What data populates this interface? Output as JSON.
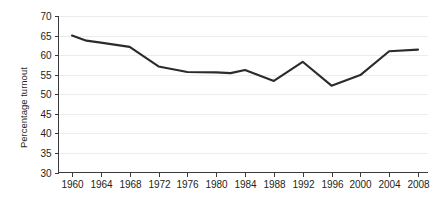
{
  "chart_data": {
    "type": "line",
    "title": "",
    "xlabel": "",
    "ylabel": "Percentage turnout",
    "categories": [
      "1960",
      "1964",
      "1968",
      "1972",
      "1976",
      "1980",
      "1984",
      "1988",
      "1992",
      "1996",
      "2000",
      "2004",
      "2008"
    ],
    "x": [
      1960,
      1964,
      1968,
      1972,
      1976,
      1980,
      1984,
      1988,
      1992,
      1996,
      2000,
      2004,
      2008
    ],
    "values": [
      65.0,
      62.1,
      60.9,
      55.2,
      53.6,
      52.6,
      53.3,
      50.2,
      55.2,
      49.0,
      51.2,
      56.7,
      58.2
    ],
    "series": [
      {
        "name": "Percentage turnout",
        "values": [
          65.0,
          62.1,
          60.9,
          55.2,
          53.6,
          52.6,
          53.3,
          50.2,
          55.2,
          49.0,
          51.2,
          56.7,
          58.2
        ]
      }
    ],
    "plot_points": [
      {
        "x": 1960,
        "y": 65.0
      },
      {
        "x": 1962,
        "y": 63.7
      },
      {
        "x": 1964,
        "y": 63.2
      },
      {
        "x": 1968,
        "y": 62.1
      },
      {
        "x": 1972,
        "y": 57.1
      },
      {
        "x": 1976,
        "y": 55.7
      },
      {
        "x": 1980,
        "y": 55.6
      },
      {
        "x": 1982,
        "y": 55.4
      },
      {
        "x": 1984,
        "y": 56.2
      },
      {
        "x": 1988,
        "y": 53.4
      },
      {
        "x": 1992,
        "y": 58.3
      },
      {
        "x": 1996,
        "y": 52.2
      },
      {
        "x": 2000,
        "y": 54.9
      },
      {
        "x": 2004,
        "y": 61.0
      },
      {
        "x": 2008,
        "y": 61.4
      }
    ],
    "ylim": [
      30,
      70
    ],
    "ytick_values": [
      30,
      35,
      40,
      45,
      50,
      55,
      60,
      65,
      70
    ],
    "ytick_labels": [
      "30",
      "35",
      "40",
      "45",
      "50",
      "55",
      "60",
      "65",
      "70"
    ],
    "xlim": [
      1960,
      2008
    ],
    "grid": "horizontal",
    "legend": "none",
    "line_color": "#2b2b2d",
    "grid_color": "#ececed",
    "axis_color": "#3b3b3d",
    "background_color": "#ffffff"
  }
}
